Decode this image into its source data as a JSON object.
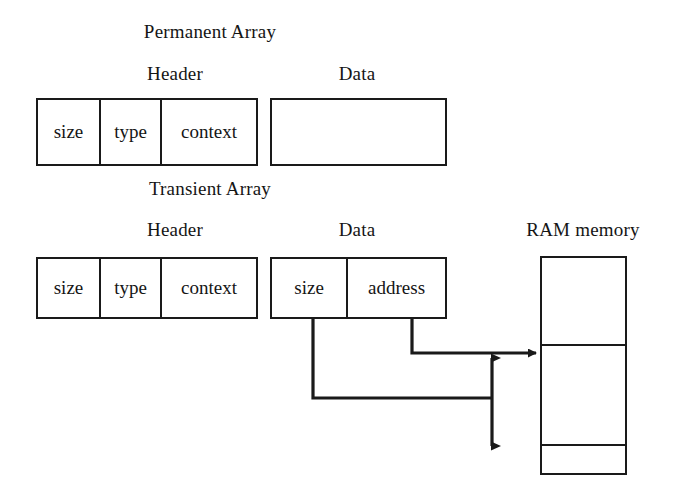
{
  "figure": {
    "title_permanent": "Permanent Array",
    "title_transient": "Transient Array",
    "ink_color": "#1a1a1a",
    "background_color": "#ffffff"
  },
  "permanent": {
    "header_label": "Header",
    "data_label": "Data",
    "header_cells": [
      "size",
      "type",
      "context"
    ],
    "data_cells": [
      ""
    ]
  },
  "transient": {
    "header_label": "Header",
    "data_label": "Data",
    "header_cells": [
      "size",
      "type",
      "context"
    ],
    "data_cells": [
      "size",
      "address"
    ]
  },
  "ram": {
    "label": "RAM memory",
    "segments": [
      "",
      "",
      ""
    ]
  }
}
